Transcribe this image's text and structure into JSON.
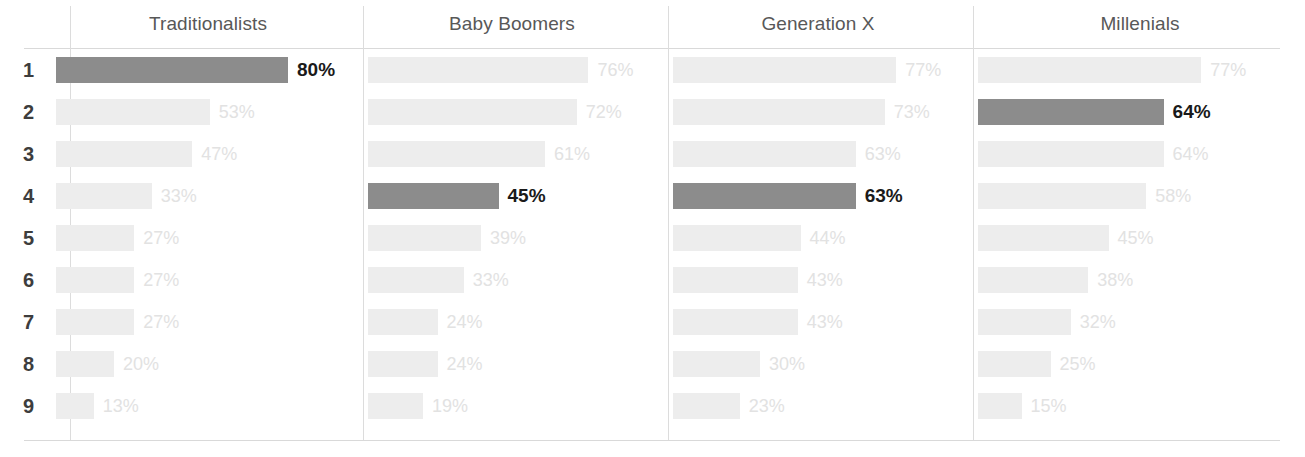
{
  "chart_data": {
    "type": "bar",
    "title": "",
    "xlabel": "",
    "ylabel": "",
    "orientation": "horizontal",
    "grid": false,
    "legend": "none",
    "xlim": [
      0,
      100
    ],
    "value_suffix": "%",
    "row_labels": [
      "1",
      "2",
      "3",
      "4",
      "5",
      "6",
      "7",
      "8",
      "9"
    ],
    "categories": [
      "1",
      "2",
      "3",
      "4",
      "5",
      "6",
      "7",
      "8",
      "9"
    ],
    "panels": [
      {
        "name": "Traditionalists",
        "values": [
          80,
          53,
          47,
          33,
          27,
          27,
          27,
          20,
          13
        ],
        "labels": [
          "80%",
          "53%",
          "47%",
          "33%",
          "27%",
          "27%",
          "27%",
          "20%",
          "13%"
        ],
        "highlight_index": 0
      },
      {
        "name": "Baby Boomers",
        "values": [
          76,
          72,
          61,
          45,
          39,
          33,
          24,
          24,
          19
        ],
        "labels": [
          "76%",
          "72%",
          "61%",
          "45%",
          "39%",
          "33%",
          "24%",
          "24%",
          "19%"
        ],
        "highlight_index": 3
      },
      {
        "name": "Generation X",
        "values": [
          77,
          73,
          63,
          63,
          44,
          43,
          43,
          30,
          23
        ],
        "labels": [
          "77%",
          "73%",
          "63%",
          "63%",
          "44%",
          "43%",
          "43%",
          "30%",
          "23%"
        ],
        "highlight_index": 3
      },
      {
        "name": "Millenials",
        "values": [
          77,
          64,
          64,
          58,
          45,
          38,
          32,
          25,
          15
        ],
        "labels": [
          "77%",
          "64%",
          "64%",
          "58%",
          "45%",
          "38%",
          "32%",
          "25%",
          "15%"
        ],
        "highlight_index": 1
      }
    ],
    "series": [
      {
        "name": "Traditionalists",
        "values": [
          80,
          53,
          47,
          33,
          27,
          27,
          27,
          20,
          13
        ]
      },
      {
        "name": "Baby Boomers",
        "values": [
          76,
          72,
          61,
          45,
          39,
          33,
          24,
          24,
          19
        ]
      },
      {
        "name": "Generation X",
        "values": [
          77,
          73,
          63,
          63,
          44,
          43,
          43,
          30,
          23
        ]
      },
      {
        "name": "Millenials",
        "values": [
          77,
          64,
          64,
          58,
          45,
          38,
          32,
          25,
          15
        ]
      }
    ],
    "colors": {
      "highlight_bar": "#8c8c8c",
      "muted_bar": "#ededed",
      "highlight_label": "#1a1a1a",
      "muted_label": "#e2e2e2",
      "header_text": "#585858",
      "row_index_text": "#3d3d3d",
      "divider": "#dcdcdc",
      "background": "#ffffff"
    }
  },
  "layout": {
    "panel_lefts": [
      56,
      368,
      673,
      978
    ],
    "panel_widths": [
      290,
      298,
      290,
      290
    ],
    "divider_xs": [
      70,
      363,
      668,
      973
    ],
    "header_centers": [
      208,
      512,
      818,
      1140
    ]
  }
}
